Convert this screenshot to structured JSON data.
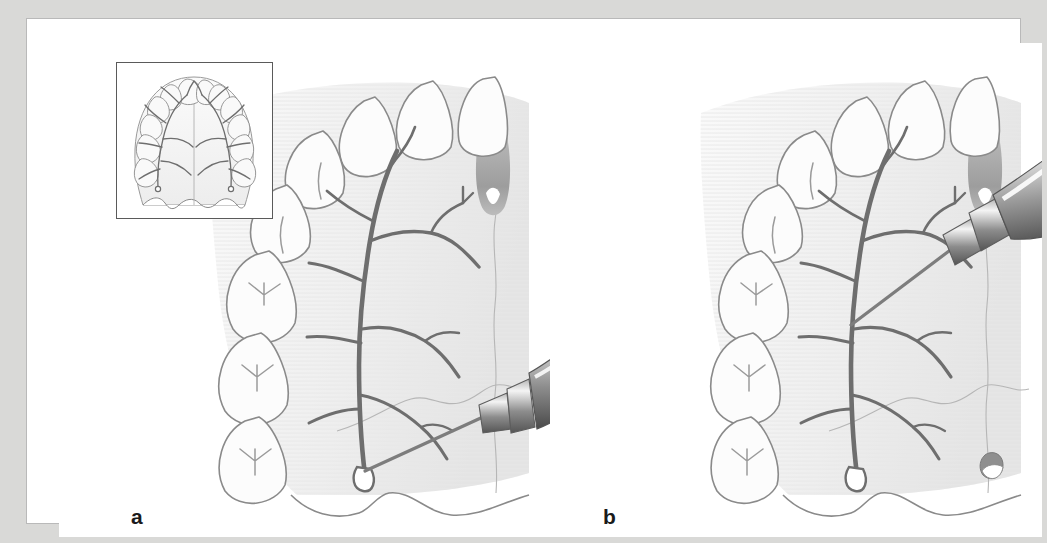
{
  "figure": {
    "domain_kind": "anatomical-illustration",
    "background_color": "#d9d9d7",
    "mat_color": "#ffffff",
    "frame_border_color": "#b9b9b9",
    "panel_count": 2
  },
  "panels": [
    {
      "id": "a",
      "label": "a",
      "technique": "greater-palatine-nerve-block",
      "needle_angle_deg": 28,
      "needle_target": "greater palatine foramen",
      "syringe_orientation": "shallow, from contralateral side, low to the palate",
      "has_inset": true
    },
    {
      "id": "b",
      "label": "b",
      "technique": "palatal-infiltration",
      "needle_angle_deg": 34,
      "needle_target": "mid-palatal nerve branch anterior to foramen",
      "syringe_orientation": "steeper, barrel window visible, entering high across the arch",
      "has_inset": false
    }
  ],
  "inset": {
    "name": "full-palate-overview",
    "description": "Hard palate with complete maxillary dental arch and bilateral greater palatine nerve distribution",
    "border_color": "#5a5a5a"
  },
  "anatomy": {
    "structures": [
      "maxillary central incisor",
      "maxillary lateral incisor",
      "canine",
      "first premolar",
      "second premolar",
      "first molar",
      "second molar",
      "third molar",
      "incisive papilla",
      "median palatine suture",
      "transverse palatine suture",
      "greater palatine foramen",
      "greater palatine nerve",
      "nasopalatine nerve",
      "soft palate margin"
    ],
    "nerve_color": "#6e6e6e",
    "tooth_outline_color": "#8a8a8a",
    "palate_shade_color": "#ededed",
    "foramen_color": "#7a7a7a"
  },
  "instrument": {
    "name": "dental-aspirating-syringe",
    "needle_color": "#8f8f8f",
    "barrel_highlight": "#ffffff",
    "barrel_shadow": "#4f4f4f",
    "hub_color": "#9b9b9b"
  }
}
